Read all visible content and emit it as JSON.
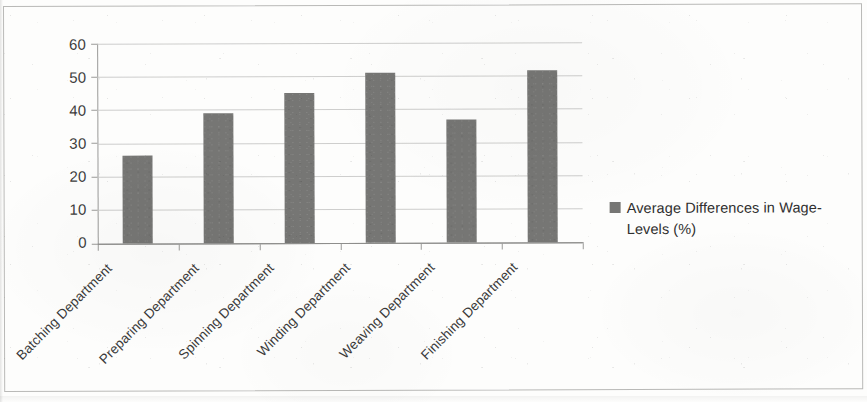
{
  "chart_data": {
    "type": "bar",
    "title": "",
    "subtitle": "",
    "xlabel": "",
    "ylabel": "",
    "ylim": [
      0,
      60
    ],
    "ytick_step": 10,
    "ytick_labels": [
      "60",
      "50",
      "40",
      "30",
      "20",
      "10",
      "0"
    ],
    "grid": true,
    "legend_position": "right",
    "categories": [
      "Batching Department",
      "Preparing Department",
      "Spinning Department",
      "Winding Department",
      "Weaving Department",
      "Finishing Department"
    ],
    "series": [
      {
        "name": "Average Differences in Wage-Levels (%)",
        "color": "#767674",
        "values": [
          26.5,
          39,
          45,
          51,
          37,
          51.5
        ]
      }
    ]
  },
  "legend": {
    "entries": [
      {
        "label": "Average Differences in Wage-Levels (%)",
        "color": "#767674"
      }
    ]
  },
  "axes": {
    "y": {
      "ticks": [
        "60",
        "50",
        "40",
        "30",
        "20",
        "10",
        "0"
      ]
    },
    "x": {
      "ticks": [
        "Batching Department",
        "Preparing Department",
        "Spinning Department",
        "Winding Department",
        "Weaving Department",
        "Finishing Department"
      ]
    }
  },
  "style": {
    "bar_color": "#767674",
    "gridline_color": "#c6c6c4",
    "axis_color": "#8e8e8c",
    "frame_color": "#b9b9b7",
    "text_color": "#3a3a3a",
    "background": "#fdfdfc"
  }
}
